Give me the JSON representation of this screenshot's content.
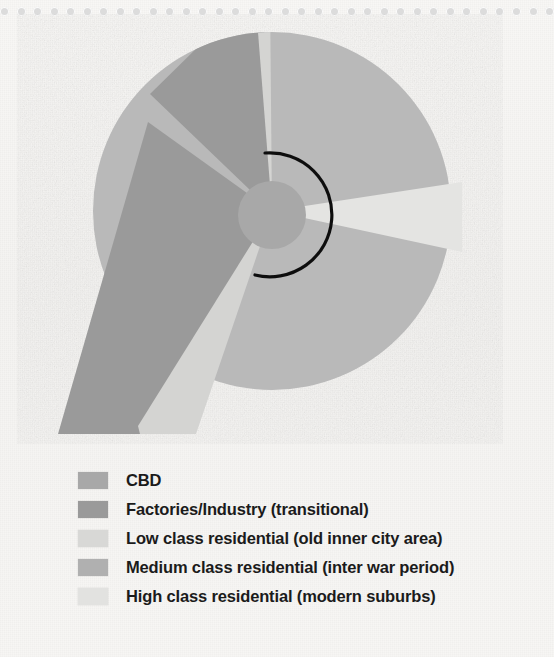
{
  "page": {
    "background_color": "#f6f5f3",
    "perforation": {
      "dot_count": 34,
      "dot_color": "#dcdcdc"
    }
  },
  "diagram": {
    "name": "hoyt-sector-model",
    "outer_circle": {
      "cx": 272,
      "cy": 197,
      "r": 179,
      "fill": "#b9b9b9"
    },
    "cbd_circle": {
      "cx": 272,
      "cy": 201,
      "r": 34,
      "fill": "#a8a8a8"
    },
    "arc": {
      "color": "#111111",
      "radius": 62,
      "start_deg": -96,
      "end_deg": 108
    }
  },
  "colors": {
    "cbd": "#a8a8a8",
    "factories": "#9a9a9a",
    "low_class": "#d4d4d2",
    "medium_class": "#b9b9b9",
    "high_class": "#e4e4e2",
    "background": "#f6f5f3",
    "arc_stroke": "#111111",
    "legend_text": "#1b1b1b"
  },
  "legend": {
    "items": [
      {
        "label": "CBD",
        "swatch": "#a8a8a8",
        "key": "cbd"
      },
      {
        "label": "Factories/Industry (transitional)",
        "swatch": "#9a9a9a",
        "key": "factories"
      },
      {
        "label": "Low class residential (old inner city area)",
        "swatch": "#d8d8d6",
        "key": "low-class"
      },
      {
        "label": "Medium class residential (inter war period)",
        "swatch": "#b0b0b0",
        "key": "medium-class"
      },
      {
        "label": "High class residential (modern suburbs)",
        "swatch": "#e2e2e0",
        "key": "high-class"
      }
    ]
  },
  "chart_data": {
    "type": "pie",
    "categories": [
      "CBD",
      "Factories/Industry (transitional)",
      "Low class residential (old inner city area)",
      "Medium class residential (inter war period)",
      "High class residential (modern suburbs)"
    ],
    "sectors": [
      {
        "name": "CBD",
        "shape": "central-circle",
        "radius_px": 34,
        "color": "#a8a8a8"
      },
      {
        "name": "Factories/Industry (transitional)",
        "shape": "sector",
        "start_deg": 205,
        "end_deg": 262,
        "color": "#9a9a9a"
      },
      {
        "name": "Low class residential (old inner city area)",
        "shape": "sector",
        "start_deg": 262,
        "end_deg": 270,
        "color": "#d4d4d2"
      },
      {
        "name": "Low class residential (old inner city area)",
        "shape": "sector",
        "start_deg": 100,
        "end_deg": 118,
        "color": "#d4d4d2"
      },
      {
        "name": "Medium class residential (inter war period)",
        "shape": "sector",
        "start_deg": 270,
        "end_deg": 100,
        "color": "#b9b9b9"
      },
      {
        "name": "High class residential (modern suburbs)",
        "shape": "sector",
        "start_deg": 352,
        "end_deg": 14,
        "color": "#e4e4e2"
      }
    ],
    "legend_position": "bottom-left",
    "grid": false,
    "xlabel": "",
    "ylabel": ""
  }
}
